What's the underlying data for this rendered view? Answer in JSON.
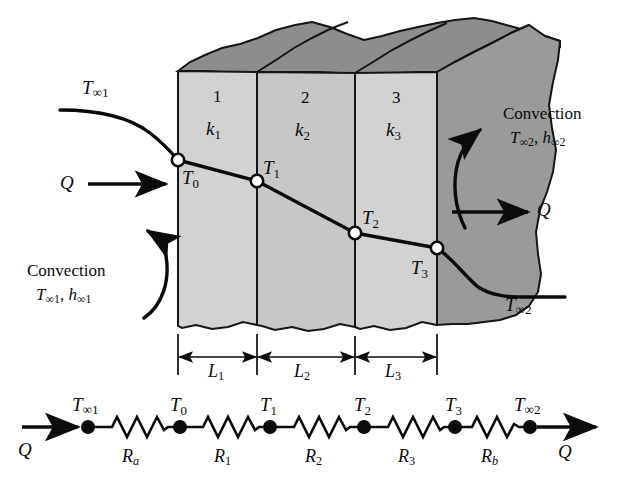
{
  "figure": {
    "colors": {
      "ink": "#0b0b0b",
      "wall_face_light": "#d2d2d2",
      "wall_face_mid": "#c3c3c3",
      "top_surface_dark": "#8d8d8d",
      "right_surface_dark": "#9a9a9a",
      "background": "#ffffff",
      "node_fill": "#ffffff"
    }
  },
  "wall": {
    "layers": [
      {
        "number": "1",
        "conductivity_base": "k",
        "conductivity_sub": "1",
        "thickness_base": "L",
        "thickness_sub": "1"
      },
      {
        "number": "2",
        "conductivity_base": "k",
        "conductivity_sub": "2",
        "thickness_base": "L",
        "thickness_sub": "2"
      },
      {
        "number": "3",
        "conductivity_base": "k",
        "conductivity_sub": "3",
        "thickness_base": "L",
        "thickness_sub": "3"
      }
    ],
    "layer_numbers": [
      "1",
      "2",
      "3"
    ],
    "conductivity_labels": [
      "k1",
      "k2",
      "k3"
    ],
    "thickness_labels": [
      "L1",
      "L2",
      "L3"
    ]
  },
  "temperature_profile": {
    "surface_nodes": [
      "T0",
      "T1",
      "T2",
      "T3"
    ],
    "node_labels": {
      "T0": {
        "base": "T",
        "sub": "0"
      },
      "T1": {
        "base": "T",
        "sub": "1"
      },
      "T2": {
        "base": "T",
        "sub": "2"
      },
      "T3": {
        "base": "T",
        "sub": "3"
      }
    },
    "fluid_labels": {
      "left": {
        "base": "T",
        "sub": "∞1"
      },
      "right": {
        "base": "T",
        "sub": "∞2"
      }
    }
  },
  "convection": {
    "left": {
      "caption": "Convection",
      "temperature_base": "T",
      "temperature_sub": "∞1",
      "coefficient_base": "h",
      "coefficient_sub": "∞1",
      "separator": ","
    },
    "right": {
      "caption": "Convection",
      "temperature_base": "T",
      "temperature_sub": "∞2",
      "coefficient_base": "h",
      "coefficient_sub": "∞2",
      "separator": ","
    }
  },
  "heat_flow": {
    "symbol": "Q",
    "labels": [
      "Q",
      "Q",
      "Q",
      "Q"
    ],
    "inlet_wall": "Q",
    "outlet_wall": "Q",
    "inlet_network": "Q",
    "outlet_network": "Q"
  },
  "network": {
    "nodes": [
      {
        "base": "T",
        "sub": "∞1"
      },
      {
        "base": "T",
        "sub": "0"
      },
      {
        "base": "T",
        "sub": "1"
      },
      {
        "base": "T",
        "sub": "2"
      },
      {
        "base": "T",
        "sub": "3"
      },
      {
        "base": "T",
        "sub": "∞2"
      }
    ],
    "node_labels": [
      "T∞1",
      "T0",
      "T1",
      "T2",
      "T3",
      "T∞2"
    ],
    "resistors": [
      {
        "base": "R",
        "sub": "a"
      },
      {
        "base": "R",
        "sub": "1"
      },
      {
        "base": "R",
        "sub": "2"
      },
      {
        "base": "R",
        "sub": "3"
      },
      {
        "base": "R",
        "sub": "b"
      }
    ],
    "resistor_labels": [
      "Ra",
      "R1",
      "R2",
      "R3",
      "Rb"
    ]
  },
  "text": {
    "T_inf1": "T",
    "T_inf1_sub": "∞1",
    "T_inf2": "T",
    "T_inf2_sub": "∞2",
    "T0": "T",
    "T0_sub": "0",
    "T1": "T",
    "T1_sub": "1",
    "T2": "T",
    "T2_sub": "2",
    "T3": "T",
    "T3_sub": "3",
    "k1": "k",
    "k1_sub": "1",
    "k2": "k",
    "k2_sub": "2",
    "k3": "k",
    "k3_sub": "3",
    "L1": "L",
    "L1_sub": "1",
    "L2": "L",
    "L2_sub": "2",
    "L3": "L",
    "L3_sub": "3",
    "n1": "1",
    "n2": "2",
    "n3": "3",
    "Ra": "R",
    "Ra_sub": "a",
    "R1": "R",
    "R1_sub": "1",
    "R2": "R",
    "R2_sub": "2",
    "R3": "R",
    "R3_sub": "3",
    "Rb": "R",
    "Rb_sub": "b",
    "Q": "Q",
    "convection": "Convection",
    "h1": "h",
    "h1_sub": "∞1",
    "h2": "h",
    "h2_sub": "∞2",
    "comma": ","
  }
}
